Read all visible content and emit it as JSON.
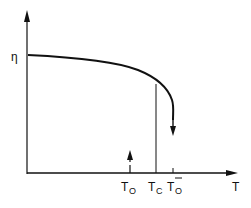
{
  "diagram": {
    "type": "order-parameter-vs-temperature",
    "y_axis": {
      "label": "η"
    },
    "x_axis": {
      "label": "T"
    },
    "markers": [
      {
        "id": "t0",
        "label_main": "T",
        "label_sub": "O",
        "description": "lower spinodal / dashed up arrow"
      },
      {
        "id": "tc",
        "label_main": "T",
        "label_sub": "C",
        "description": "transition temperature vertical line"
      },
      {
        "id": "t0bar",
        "label_main": "T",
        "label_sub": "O",
        "overbar": true,
        "description": "upper stability limit with down arrow"
      }
    ],
    "curve": "order parameter decreasing with T, dropping steeply near T0-bar, then jump down (arrow)",
    "colors": {
      "ink": "#111111",
      "background": "#ffffff"
    }
  }
}
